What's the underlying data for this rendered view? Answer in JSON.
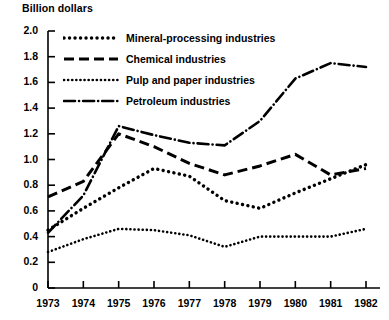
{
  "chart_data": {
    "type": "line",
    "title": "Billion dollars",
    "xlabel": "",
    "ylabel": "Billion dollars",
    "grid": false,
    "legend_position": "top-left-inside",
    "x": [
      1973,
      1974,
      1975,
      1976,
      1977,
      1978,
      1979,
      1980,
      1981,
      1982
    ],
    "xtick_labels": [
      "1973",
      "1974",
      "1975",
      "1976",
      "1977",
      "1978",
      "1979",
      "1980",
      "1981",
      "1982"
    ],
    "xlim": [
      1973,
      1982
    ],
    "ylim": [
      0,
      2.0
    ],
    "ytick_labels": [
      "0",
      "0.2",
      "0.4",
      "0.6",
      "0.8",
      "1.0",
      "1.2",
      "1.4",
      "1.6",
      "1.8",
      "2.0"
    ],
    "ytick_values": [
      0,
      0.2,
      0.4,
      0.6,
      0.8,
      1.0,
      1.2,
      1.4,
      1.6,
      1.8,
      2.0
    ],
    "series": [
      {
        "name": "Mineral-processing industries",
        "style": "dotted",
        "color": "#000000",
        "values": [
          0.45,
          0.62,
          0.78,
          0.93,
          0.87,
          0.68,
          0.62,
          0.74,
          0.85,
          0.96
        ]
      },
      {
        "name": "Chemical industries",
        "style": "dashed",
        "color": "#000000",
        "values": [
          0.71,
          0.83,
          1.2,
          1.1,
          0.97,
          0.88,
          0.95,
          1.04,
          0.88,
          0.93
        ]
      },
      {
        "name": "Pulp and paper industries",
        "style": "fine-dotted",
        "color": "#000000",
        "values": [
          0.28,
          0.38,
          0.46,
          0.45,
          0.41,
          0.32,
          0.4,
          0.4,
          0.4,
          0.46
        ]
      },
      {
        "name": "Petroleum industries",
        "style": "dash-dot",
        "color": "#000000",
        "values": [
          0.43,
          0.72,
          1.26,
          1.19,
          1.13,
          1.11,
          1.3,
          1.63,
          1.75,
          1.72
        ]
      }
    ]
  },
  "legend": [
    {
      "label": "Mineral-processing industries",
      "style": "dotted"
    },
    {
      "label": "Chemical industries",
      "style": "dashed"
    },
    {
      "label": "Pulp and paper industries",
      "style": "fine-dotted"
    },
    {
      "label": "Petroleum industries",
      "style": "dash-dot"
    }
  ]
}
